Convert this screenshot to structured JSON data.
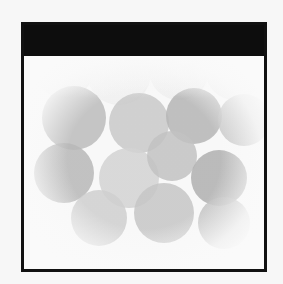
{
  "image": {
    "description": "Grayscale bokeh image: overlapping soft circles with vignette inside a black-bordered frame with a solid black header bar",
    "header_title": "",
    "colors": {
      "frame_border": "#111111",
      "header_bg": "#0d0d0d",
      "background": "#fafafa"
    },
    "bubbles": [
      {
        "x": 20,
        "y": -10,
        "r": 30,
        "shade": "#eeeeee"
      },
      {
        "x": 75,
        "y": -5,
        "r": 32,
        "shade": "#f0f0f0"
      },
      {
        "x": 135,
        "y": -8,
        "r": 30,
        "shade": "#efefef"
      },
      {
        "x": 190,
        "y": -6,
        "r": 28,
        "shade": "#eeeeee"
      },
      {
        "x": 30,
        "y": 40,
        "r": 32,
        "shade": "#bcbcbc"
      },
      {
        "x": 95,
        "y": 45,
        "r": 30,
        "shade": "#c9c9c9"
      },
      {
        "x": 150,
        "y": 38,
        "r": 28,
        "shade": "#b5b5b5"
      },
      {
        "x": 200,
        "y": 42,
        "r": 26,
        "shade": "#c4c4c4"
      },
      {
        "x": 20,
        "y": 95,
        "r": 30,
        "shade": "#b8b8b8"
      },
      {
        "x": 85,
        "y": 100,
        "r": 30,
        "shade": "#d3d3d3"
      },
      {
        "x": 128,
        "y": 78,
        "r": 25,
        "shade": "#c2c2c2"
      },
      {
        "x": 175,
        "y": 100,
        "r": 28,
        "shade": "#b0b0b0"
      },
      {
        "x": 55,
        "y": 140,
        "r": 28,
        "shade": "#cfcfcf"
      },
      {
        "x": 120,
        "y": 135,
        "r": 30,
        "shade": "#c6c6c6"
      },
      {
        "x": 180,
        "y": 145,
        "r": 26,
        "shade": "#c0c0c0"
      }
    ]
  }
}
